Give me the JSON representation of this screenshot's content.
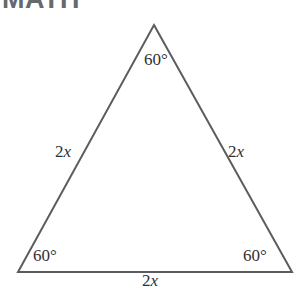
{
  "header": {
    "title": "MATH"
  },
  "figure": {
    "shape_name": "equilateral-triangle",
    "stroke_color": "#5a5d60",
    "stroke_width": 2,
    "background_color": "#ffffff",
    "vertices": {
      "apex": {
        "x": 154,
        "y": 25
      },
      "bottom_left": {
        "x": 18,
        "y": 272
      },
      "bottom_right": {
        "x": 292,
        "y": 272
      }
    },
    "angles": {
      "apex": "60°",
      "bottom_left": "60°",
      "bottom_right": "60°"
    },
    "sides": {
      "left": {
        "coefficient": "2",
        "variable": "x"
      },
      "right": {
        "coefficient": "2",
        "variable": "x"
      },
      "bottom": {
        "coefficient": "2",
        "variable": "x"
      }
    }
  }
}
